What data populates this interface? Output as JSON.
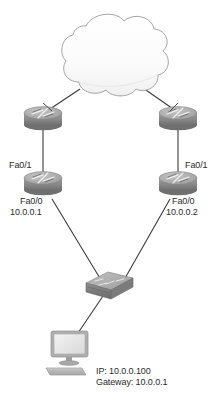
{
  "diagram": {
    "type": "network-topology",
    "title": "",
    "colors": {
      "background": "#ffffff",
      "link_line": "#3b3b3b",
      "text": "#2b2b2b",
      "cloud_fill": "#fbfbfb",
      "cloud_stroke": "#9a9a9a",
      "device_body": "#8e8e8e",
      "device_top": "#b4b4b4",
      "device_dark": "#6d6d6d",
      "monitor_screen": "#e9e9e9",
      "monitor_frame": "#a8a8a8"
    },
    "nodes": [
      {
        "id": "internet-cloud",
        "kind": "cloud",
        "label": ""
      },
      {
        "id": "router-top-left",
        "kind": "router",
        "label": ""
      },
      {
        "id": "router-top-right",
        "kind": "router",
        "label": ""
      },
      {
        "id": "router-left",
        "kind": "router",
        "interface_upper": "Fa0/1",
        "interface_lower": "Fa0/0",
        "ip": "10.0.0.1"
      },
      {
        "id": "router-right",
        "kind": "router",
        "interface_upper": "Fa0/1",
        "interface_lower": "Fa0/0",
        "ip": "10.0.0.2"
      },
      {
        "id": "switch",
        "kind": "switch",
        "label": ""
      },
      {
        "id": "pc",
        "kind": "workstation",
        "ip_line": "IP: 10.0.0.100",
        "gateway_line": "Gateway: 10.0.0.1"
      }
    ],
    "links": [
      {
        "from": "internet-cloud",
        "to": "router-top-left"
      },
      {
        "from": "internet-cloud",
        "to": "router-top-right"
      },
      {
        "from": "router-top-left",
        "to": "router-left"
      },
      {
        "from": "router-top-right",
        "to": "router-right"
      },
      {
        "from": "router-left",
        "to": "switch"
      },
      {
        "from": "router-right",
        "to": "switch"
      },
      {
        "from": "switch",
        "to": "pc"
      }
    ],
    "labels": {
      "left_router_fa01": "Fa0/1",
      "left_router_fa00": "Fa0/0",
      "left_router_ip": "10.0.0.1",
      "right_router_fa01": "Fa0/1",
      "right_router_fa00": "Fa0/0",
      "right_router_ip": "10.0.0.2",
      "pc_ip": "IP: 10.0.0.100",
      "pc_gateway": "Gateway: 10.0.0.1"
    }
  }
}
